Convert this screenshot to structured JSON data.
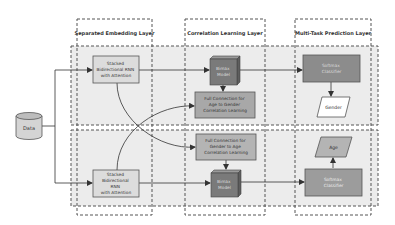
{
  "layers": {
    "embedding": "Separated Embedding Layer",
    "correlation": "Correlation Learning Layer",
    "prediction": "Multi-Task Prediction Layer"
  },
  "nodes": {
    "data": "Data",
    "rnn_top": [
      "Stacked",
      "Bidirectional RNN",
      "with Attention"
    ],
    "rnn_bottom": [
      "Stacked",
      "Bidirectional",
      "RNN",
      "with Attention"
    ],
    "bimax_top": [
      "Bimax",
      "Model"
    ],
    "bimax_bottom": [
      "Bimax",
      "Model"
    ],
    "fc_top": [
      "Full Connection for",
      "Age to Gender",
      "Correlation Learning"
    ],
    "fc_bottom": [
      "Full Connection for",
      "Gender to Age",
      "Correlation Learning"
    ],
    "softmax_top": [
      "Softmax",
      "Classifier"
    ],
    "softmax_bottom": [
      "Softmax",
      "Classifier"
    ],
    "gender": "Gender",
    "age": "Age"
  },
  "colors": {
    "band_fill": "#ececec",
    "box_fill_light": "#c8c8c8",
    "box_fill_dark": "#8c8c8c",
    "model_fill": "#7a7a7a",
    "rnn_fill": "#dcdcdc",
    "stroke": "#555555"
  }
}
